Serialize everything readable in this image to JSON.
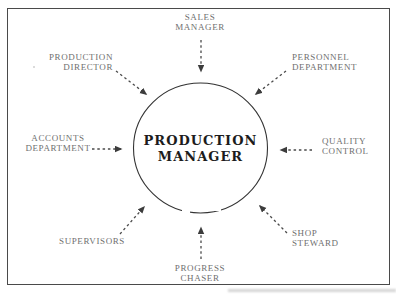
{
  "diagram": {
    "center": {
      "line1": "PRODUCTION",
      "line2": "MANAGER"
    },
    "nodes": [
      {
        "id": "sales-manager",
        "line1": "SALES",
        "line2": "MANAGER"
      },
      {
        "id": "production-director",
        "line1": "PRODUCTION",
        "line2": "DIRECTOR"
      },
      {
        "id": "personnel-department",
        "line1": "PERSONNEL",
        "line2": "DEPARTMENT"
      },
      {
        "id": "accounts-department",
        "line1": "ACCOUNTS",
        "line2": "DEPARTMENT"
      },
      {
        "id": "quality-control",
        "line1": "QUALITY",
        "line2": "CONTROL"
      },
      {
        "id": "supervisors",
        "line1": "SUPERVISORS",
        "line2": ""
      },
      {
        "id": "shop-steward",
        "line1": "SHOP",
        "line2": "STEWARD"
      },
      {
        "id": "progress-chaser",
        "line1": "PROGRESS",
        "line2": "CHASER"
      }
    ],
    "colors": {
      "background": "#ffffff",
      "frame_border": "#4a4a4a",
      "circle_stroke": "#333333",
      "arrow": "#4a4a4a",
      "label_text": "#6f6f6f",
      "center_text": "#1c1c1c"
    }
  }
}
